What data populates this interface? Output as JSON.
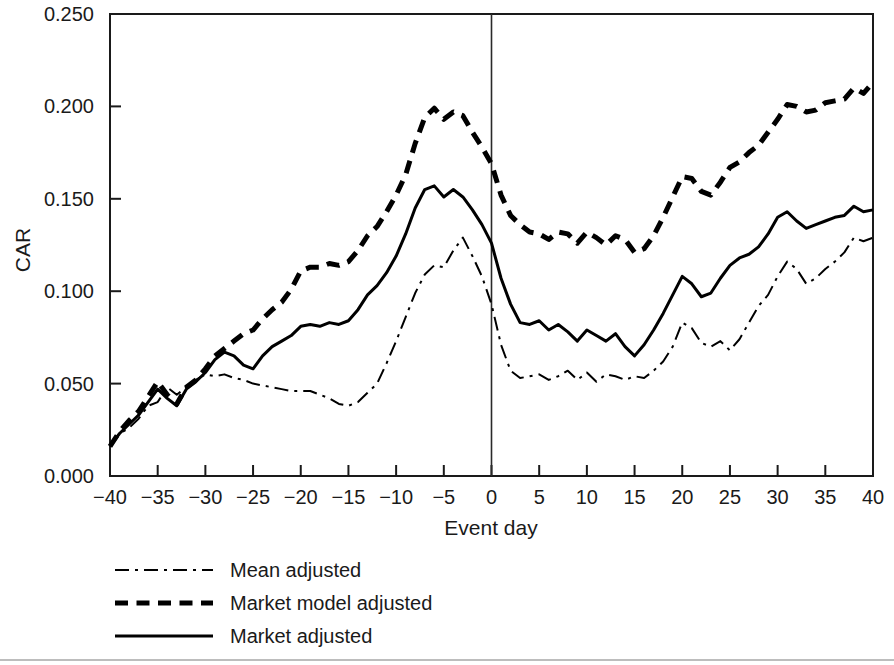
{
  "chart_data": {
    "type": "line",
    "title": "",
    "xlabel": "Event day",
    "ylabel": "CAR",
    "xlim": [
      -40,
      40
    ],
    "ylim": [
      0.0,
      0.25
    ],
    "xticks": [
      -40,
      -35,
      -30,
      -25,
      -20,
      -15,
      -10,
      -5,
      0,
      5,
      10,
      15,
      20,
      25,
      30,
      35,
      40
    ],
    "xtick_labels": [
      "−40",
      "−35",
      "−30",
      "−25",
      "−20",
      "−15",
      "−10",
      "−5",
      "0",
      "5",
      "10",
      "15",
      "20",
      "25",
      "30",
      "35",
      "40"
    ],
    "yticks": [
      0.0,
      0.05,
      0.1,
      0.15,
      0.2,
      0.25
    ],
    "ytick_labels": [
      "0.000",
      "0.050",
      "0.100",
      "0.150",
      "0.200",
      "0.250"
    ],
    "grid": false,
    "legend_position": "below-axes-left",
    "annotations": [
      {
        "name": "event-day-vline",
        "type": "vline",
        "x": 0,
        "label": ""
      }
    ],
    "x": [
      -40,
      -39,
      -38,
      -37,
      -36,
      -35,
      -34,
      -33,
      -32,
      -31,
      -30,
      -29,
      -28,
      -27,
      -26,
      -25,
      -24,
      -23,
      -22,
      -21,
      -20,
      -19,
      -18,
      -17,
      -16,
      -15,
      -14,
      -13,
      -12,
      -11,
      -10,
      -9,
      -8,
      -7,
      -6,
      -5,
      -4,
      -3,
      -2,
      -1,
      0,
      1,
      2,
      3,
      4,
      5,
      6,
      7,
      8,
      9,
      10,
      11,
      12,
      13,
      14,
      15,
      16,
      17,
      18,
      19,
      20,
      21,
      22,
      23,
      24,
      25,
      26,
      27,
      28,
      29,
      30,
      31,
      32,
      33,
      34,
      35,
      36,
      37,
      38,
      39,
      40
    ],
    "series": [
      {
        "name": "Mean adjusted",
        "style": "dashdot",
        "linewidth": 2,
        "color": "#000000",
        "values": [
          0.016,
          0.023,
          0.026,
          0.031,
          0.038,
          0.04,
          0.048,
          0.044,
          0.048,
          0.052,
          0.055,
          0.054,
          0.055,
          0.053,
          0.052,
          0.05,
          0.049,
          0.048,
          0.047,
          0.046,
          0.046,
          0.046,
          0.044,
          0.042,
          0.039,
          0.038,
          0.04,
          0.045,
          0.05,
          0.061,
          0.073,
          0.086,
          0.099,
          0.109,
          0.114,
          0.113,
          0.122,
          0.129,
          0.119,
          0.108,
          0.093,
          0.071,
          0.057,
          0.053,
          0.054,
          0.055,
          0.052,
          0.054,
          0.057,
          0.052,
          0.056,
          0.051,
          0.055,
          0.054,
          0.052,
          0.054,
          0.053,
          0.057,
          0.062,
          0.07,
          0.083,
          0.08,
          0.072,
          0.07,
          0.073,
          0.068,
          0.074,
          0.083,
          0.092,
          0.098,
          0.108,
          0.116,
          0.112,
          0.104,
          0.107,
          0.112,
          0.116,
          0.121,
          0.129,
          0.127,
          0.129
        ]
      },
      {
        "name": "Market model adjusted",
        "style": "dashed",
        "linewidth": 5,
        "color": "#000000",
        "values": [
          0.016,
          0.024,
          0.03,
          0.035,
          0.043,
          0.051,
          0.044,
          0.039,
          0.048,
          0.052,
          0.058,
          0.065,
          0.069,
          0.073,
          0.077,
          0.079,
          0.085,
          0.09,
          0.094,
          0.101,
          0.111,
          0.113,
          0.113,
          0.115,
          0.114,
          0.116,
          0.122,
          0.13,
          0.135,
          0.143,
          0.152,
          0.163,
          0.18,
          0.194,
          0.199,
          0.193,
          0.197,
          0.195,
          0.186,
          0.178,
          0.169,
          0.152,
          0.141,
          0.136,
          0.132,
          0.131,
          0.128,
          0.132,
          0.131,
          0.126,
          0.132,
          0.129,
          0.125,
          0.13,
          0.128,
          0.121,
          0.123,
          0.13,
          0.14,
          0.151,
          0.162,
          0.161,
          0.154,
          0.152,
          0.159,
          0.167,
          0.17,
          0.175,
          0.179,
          0.186,
          0.193,
          0.201,
          0.2,
          0.197,
          0.198,
          0.202,
          0.203,
          0.204,
          0.21,
          0.207,
          0.213
        ]
      },
      {
        "name": "Market adjusted",
        "style": "solid",
        "linewidth": 3,
        "color": "#000000",
        "values": [
          0.016,
          0.023,
          0.028,
          0.033,
          0.04,
          0.047,
          0.042,
          0.038,
          0.047,
          0.051,
          0.056,
          0.063,
          0.067,
          0.065,
          0.06,
          0.058,
          0.065,
          0.07,
          0.073,
          0.076,
          0.081,
          0.082,
          0.081,
          0.083,
          0.082,
          0.084,
          0.09,
          0.098,
          0.103,
          0.11,
          0.119,
          0.131,
          0.145,
          0.155,
          0.157,
          0.151,
          0.155,
          0.151,
          0.144,
          0.136,
          0.126,
          0.107,
          0.093,
          0.083,
          0.082,
          0.084,
          0.079,
          0.082,
          0.078,
          0.073,
          0.079,
          0.076,
          0.073,
          0.077,
          0.07,
          0.065,
          0.071,
          0.079,
          0.088,
          0.098,
          0.108,
          0.104,
          0.097,
          0.099,
          0.107,
          0.114,
          0.118,
          0.12,
          0.124,
          0.131,
          0.14,
          0.143,
          0.138,
          0.134,
          0.136,
          0.138,
          0.14,
          0.141,
          0.146,
          0.143,
          0.144
        ]
      }
    ]
  },
  "legend": {
    "items": [
      {
        "label": "Mean adjusted",
        "style": "dashdot"
      },
      {
        "label": "Market model adjusted",
        "style": "dashed"
      },
      {
        "label": "Market adjusted",
        "style": "solid"
      }
    ]
  }
}
